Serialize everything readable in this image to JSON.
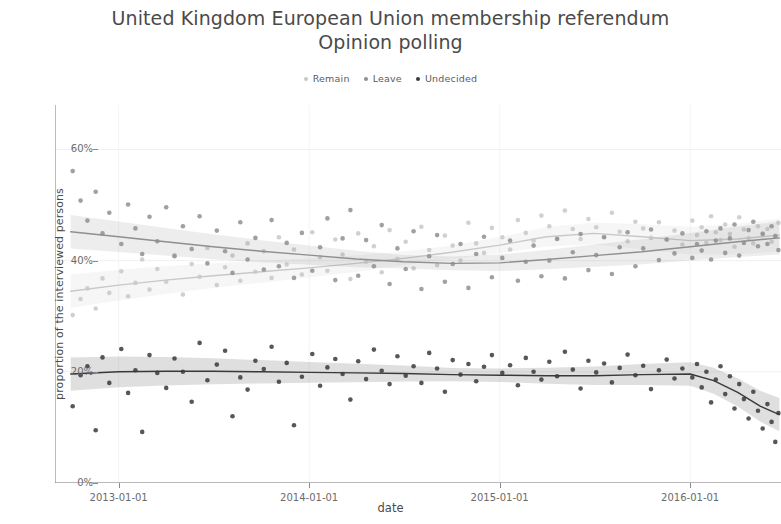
{
  "title": {
    "line1": "United Kingdom European Union membership referendum",
    "line2": "Opinion polling"
  },
  "legend": {
    "position": "top-center",
    "items": [
      {
        "label": "Remain",
        "color": "#c8c8c8"
      },
      {
        "label": "Leave",
        "color": "#8f8f8f"
      },
      {
        "label": "Undecided",
        "color": "#3a3a3a"
      }
    ]
  },
  "axes": {
    "ylabel": "proportion of the interviewed persons",
    "xlabel": "date",
    "yticks": [
      "0%",
      "20%",
      "40%",
      "60%"
    ],
    "xticks": [
      "2013-01-01",
      "2014-01-01",
      "2015-01-01",
      "2016-01-01"
    ]
  },
  "chart_data": {
    "type": "scatter",
    "title": "United Kingdom European Union membership referendum Opinion polling",
    "xlabel": "date",
    "ylabel": "proportion of the interviewed persons",
    "grid": true,
    "legend_position": "top-center",
    "xlim": [
      "2012-09-01",
      "2016-06-23"
    ],
    "ylim": [
      0,
      0.68
    ],
    "ytick_values": [
      0,
      20,
      40,
      60
    ],
    "ytick_labels": [
      "0%",
      "20%",
      "40%",
      "60%"
    ],
    "xtick_values": [
      "2013-01-01",
      "2014-01-01",
      "2015-01-01",
      "2016-01-01"
    ],
    "series": [
      {
        "name": "Remain",
        "color": "#c8c8c8",
        "trend": {
          "x": [
            "2012-10-01",
            "2013-01-01",
            "2013-04-01",
            "2013-07-01",
            "2013-10-01",
            "2014-01-01",
            "2014-04-01",
            "2014-07-01",
            "2014-10-01",
            "2015-01-01",
            "2015-04-01",
            "2015-07-01",
            "2015-10-01",
            "2016-01-01",
            "2016-04-01",
            "2016-06-20"
          ],
          "y": [
            34.5,
            35.6,
            36.5,
            37.3,
            38.0,
            38.7,
            39.5,
            40.4,
            41.5,
            42.8,
            44.3,
            44.9,
            44.3,
            43.6,
            43.9,
            44.6
          ]
        },
        "points": {
          "x": [
            "2012-10-05",
            "2012-10-20",
            "2012-11-02",
            "2012-11-18",
            "2012-12-01",
            "2012-12-14",
            "2013-01-06",
            "2013-01-19",
            "2013-02-02",
            "2013-02-15",
            "2013-03-01",
            "2013-03-16",
            "2013-04-02",
            "2013-04-18",
            "2013-05-04",
            "2013-05-21",
            "2013-06-05",
            "2013-06-20",
            "2013-07-08",
            "2013-07-24",
            "2013-08-07",
            "2013-08-22",
            "2013-09-05",
            "2013-09-20",
            "2013-10-06",
            "2013-10-21",
            "2013-11-04",
            "2013-11-19",
            "2013-12-03",
            "2013-12-18",
            "2014-01-07",
            "2014-01-22",
            "2014-02-05",
            "2014-02-20",
            "2014-03-06",
            "2014-03-21",
            "2014-04-05",
            "2014-04-20",
            "2014-05-05",
            "2014-05-20",
            "2014-06-04",
            "2014-06-19",
            "2014-07-05",
            "2014-07-20",
            "2014-08-04",
            "2014-08-19",
            "2014-09-03",
            "2014-09-18",
            "2014-10-03",
            "2014-10-18",
            "2014-11-02",
            "2014-11-17",
            "2014-12-02",
            "2014-12-17",
            "2015-01-06",
            "2015-01-21",
            "2015-02-05",
            "2015-02-20",
            "2015-03-07",
            "2015-03-22",
            "2015-04-06",
            "2015-04-21",
            "2015-05-06",
            "2015-05-21",
            "2015-06-05",
            "2015-06-20",
            "2015-07-05",
            "2015-07-20",
            "2015-08-04",
            "2015-08-19",
            "2015-09-03",
            "2015-09-18",
            "2015-10-03",
            "2015-10-18",
            "2015-11-02",
            "2015-11-17",
            "2015-12-02",
            "2015-12-17",
            "2016-01-05",
            "2016-01-14",
            "2016-01-23",
            "2016-02-01",
            "2016-02-10",
            "2016-02-19",
            "2016-02-28",
            "2016-03-08",
            "2016-03-17",
            "2016-03-26",
            "2016-04-04",
            "2016-04-13",
            "2016-04-22",
            "2016-05-01",
            "2016-05-10",
            "2016-05-19",
            "2016-05-28",
            "2016-06-05",
            "2016-06-12",
            "2016-06-18"
          ],
          "y": [
            30.2,
            33.1,
            35.0,
            31.4,
            36.8,
            34.2,
            38.1,
            33.6,
            36.0,
            40.2,
            34.8,
            38.5,
            36.2,
            41.0,
            33.9,
            39.4,
            37.1,
            42.3,
            35.6,
            38.8,
            40.9,
            36.4,
            43.1,
            38.0,
            41.7,
            36.9,
            44.2,
            39.3,
            42.0,
            37.5,
            45.1,
            40.6,
            38.2,
            43.8,
            41.1,
            36.7,
            44.9,
            39.8,
            42.6,
            37.9,
            45.5,
            40.3,
            43.4,
            38.6,
            46.1,
            41.9,
            39.2,
            44.5,
            42.7,
            40.0,
            46.8,
            43.1,
            41.4,
            45.9,
            44.2,
            42.0,
            47.3,
            45.0,
            43.6,
            48.1,
            46.2,
            44.0,
            49.0,
            45.7,
            43.9,
            47.5,
            46.0,
            44.3,
            48.6,
            45.2,
            43.5,
            47.0,
            45.8,
            44.1,
            46.9,
            43.8,
            45.4,
            42.9,
            47.2,
            44.6,
            46.0,
            43.2,
            48.0,
            45.1,
            43.7,
            46.5,
            44.8,
            42.5,
            47.8,
            45.6,
            44.0,
            43.1,
            46.2,
            44.9,
            45.7,
            43.4,
            44.5,
            46.8,
            45.0,
            44.2
          ]
        }
      },
      {
        "name": "Leave",
        "color": "#8f8f8f",
        "trend": {
          "x": [
            "2012-10-01",
            "2013-01-01",
            "2013-04-01",
            "2013-07-01",
            "2013-10-01",
            "2014-01-01",
            "2014-04-01",
            "2014-07-01",
            "2014-10-01",
            "2015-01-01",
            "2015-04-01",
            "2015-07-01",
            "2015-10-01",
            "2016-01-01",
            "2016-04-01",
            "2016-06-20"
          ],
          "y": [
            45.2,
            44.3,
            43.4,
            42.5,
            41.7,
            41.0,
            40.3,
            39.8,
            39.5,
            39.6,
            40.2,
            40.9,
            41.6,
            42.5,
            43.4,
            44.1
          ]
        },
        "points": {
          "x": [
            "2012-10-05",
            "2012-10-20",
            "2012-11-02",
            "2012-11-18",
            "2012-12-01",
            "2012-12-14",
            "2013-01-06",
            "2013-01-19",
            "2013-02-02",
            "2013-02-15",
            "2013-03-01",
            "2013-03-16",
            "2013-04-02",
            "2013-04-18",
            "2013-05-04",
            "2013-05-21",
            "2013-06-05",
            "2013-06-20",
            "2013-07-08",
            "2013-07-24",
            "2013-08-07",
            "2013-08-22",
            "2013-09-05",
            "2013-09-20",
            "2013-10-06",
            "2013-10-21",
            "2013-11-04",
            "2013-11-19",
            "2013-12-03",
            "2013-12-18",
            "2014-01-07",
            "2014-01-22",
            "2014-02-05",
            "2014-02-20",
            "2014-03-06",
            "2014-03-21",
            "2014-04-05",
            "2014-04-20",
            "2014-05-05",
            "2014-05-20",
            "2014-06-04",
            "2014-06-19",
            "2014-07-05",
            "2014-07-20",
            "2014-08-04",
            "2014-08-19",
            "2014-09-03",
            "2014-09-18",
            "2014-10-03",
            "2014-10-18",
            "2014-11-02",
            "2014-11-17",
            "2014-12-02",
            "2014-12-17",
            "2015-01-06",
            "2015-01-21",
            "2015-02-05",
            "2015-02-20",
            "2015-03-07",
            "2015-03-22",
            "2015-04-06",
            "2015-04-21",
            "2015-05-06",
            "2015-05-21",
            "2015-06-05",
            "2015-06-20",
            "2015-07-05",
            "2015-07-20",
            "2015-08-04",
            "2015-08-19",
            "2015-09-03",
            "2015-09-18",
            "2015-10-03",
            "2015-10-18",
            "2015-11-02",
            "2015-11-17",
            "2015-12-02",
            "2015-12-17",
            "2016-01-05",
            "2016-01-14",
            "2016-01-23",
            "2016-02-01",
            "2016-02-10",
            "2016-02-19",
            "2016-02-28",
            "2016-03-08",
            "2016-03-17",
            "2016-03-26",
            "2016-04-04",
            "2016-04-13",
            "2016-04-22",
            "2016-05-01",
            "2016-05-10",
            "2016-05-19",
            "2016-05-28",
            "2016-06-05",
            "2016-06-12",
            "2016-06-18"
          ],
          "y": [
            56.1,
            50.8,
            47.2,
            52.4,
            44.9,
            48.6,
            43.0,
            50.1,
            45.8,
            41.2,
            47.9,
            43.5,
            49.6,
            40.8,
            46.2,
            42.1,
            48.0,
            39.5,
            45.4,
            41.7,
            37.8,
            46.9,
            40.2,
            44.1,
            38.4,
            47.3,
            39.0,
            43.2,
            36.9,
            45.0,
            38.2,
            42.4,
            47.6,
            36.5,
            44.0,
            49.1,
            37.3,
            43.7,
            39.0,
            46.4,
            35.8,
            42.2,
            38.5,
            45.3,
            34.9,
            40.8,
            44.6,
            36.2,
            39.4,
            43.0,
            35.1,
            41.2,
            44.3,
            37.0,
            40.5,
            43.6,
            36.4,
            39.8,
            42.7,
            37.2,
            40.0,
            43.9,
            36.8,
            41.5,
            44.8,
            38.3,
            41.0,
            44.2,
            37.6,
            42.4,
            45.1,
            39.0,
            42.2,
            45.6,
            40.1,
            43.8,
            41.3,
            44.9,
            40.5,
            43.0,
            41.8,
            45.3,
            40.2,
            43.6,
            45.8,
            41.4,
            44.0,
            46.5,
            40.9,
            43.2,
            45.5,
            47.0,
            42.6,
            44.8,
            43.0,
            46.2,
            44.4,
            41.9,
            43.8,
            44.7
          ]
        }
      },
      {
        "name": "Undecided",
        "color": "#3a3a3a",
        "trend": {
          "x": [
            "2012-10-01",
            "2013-01-01",
            "2013-04-01",
            "2013-07-01",
            "2013-10-01",
            "2014-01-01",
            "2014-04-01",
            "2014-07-01",
            "2014-10-01",
            "2015-01-01",
            "2015-04-01",
            "2015-07-01",
            "2015-10-01",
            "2016-01-01",
            "2016-02-15",
            "2016-04-01",
            "2016-05-15",
            "2016-06-20"
          ],
          "y": [
            19.6,
            20.0,
            20.1,
            20.1,
            20.0,
            19.9,
            19.8,
            19.7,
            19.5,
            19.4,
            19.3,
            19.3,
            19.5,
            19.6,
            18.4,
            16.3,
            13.8,
            12.3
          ]
        },
        "points": {
          "x": [
            "2012-10-05",
            "2012-10-20",
            "2012-11-02",
            "2012-11-18",
            "2012-12-01",
            "2012-12-14",
            "2013-01-06",
            "2013-01-19",
            "2013-02-02",
            "2013-02-15",
            "2013-03-01",
            "2013-03-16",
            "2013-04-02",
            "2013-04-18",
            "2013-05-04",
            "2013-05-21",
            "2013-06-05",
            "2013-06-20",
            "2013-07-08",
            "2013-07-24",
            "2013-08-07",
            "2013-08-22",
            "2013-09-05",
            "2013-09-20",
            "2013-10-06",
            "2013-10-21",
            "2013-11-04",
            "2013-11-19",
            "2013-12-03",
            "2013-12-18",
            "2014-01-07",
            "2014-01-22",
            "2014-02-05",
            "2014-02-20",
            "2014-03-06",
            "2014-03-21",
            "2014-04-05",
            "2014-04-20",
            "2014-05-05",
            "2014-05-20",
            "2014-06-04",
            "2014-06-19",
            "2014-07-05",
            "2014-07-20",
            "2014-08-04",
            "2014-08-19",
            "2014-09-03",
            "2014-09-18",
            "2014-10-03",
            "2014-10-18",
            "2014-11-02",
            "2014-11-17",
            "2014-12-02",
            "2014-12-17",
            "2015-01-06",
            "2015-01-21",
            "2015-02-05",
            "2015-02-20",
            "2015-03-07",
            "2015-03-22",
            "2015-04-06",
            "2015-04-21",
            "2015-05-06",
            "2015-05-21",
            "2015-06-05",
            "2015-06-20",
            "2015-07-05",
            "2015-07-20",
            "2015-08-04",
            "2015-08-19",
            "2015-09-03",
            "2015-09-18",
            "2015-10-03",
            "2015-10-18",
            "2015-11-02",
            "2015-11-17",
            "2015-12-02",
            "2015-12-17",
            "2016-01-05",
            "2016-01-14",
            "2016-01-23",
            "2016-02-01",
            "2016-02-10",
            "2016-02-19",
            "2016-02-28",
            "2016-03-08",
            "2016-03-17",
            "2016-03-26",
            "2016-04-04",
            "2016-04-13",
            "2016-04-22",
            "2016-05-01",
            "2016-05-10",
            "2016-05-19",
            "2016-05-28",
            "2016-06-05",
            "2016-06-12",
            "2016-06-18"
          ],
          "y": [
            13.8,
            19.4,
            21.0,
            9.5,
            22.6,
            18.0,
            24.1,
            16.2,
            20.3,
            9.2,
            23.0,
            19.8,
            17.1,
            22.4,
            20.0,
            14.6,
            25.2,
            18.5,
            21.3,
            23.8,
            12.0,
            19.0,
            16.8,
            22.0,
            20.5,
            24.5,
            18.2,
            21.6,
            10.4,
            19.1,
            23.2,
            17.5,
            20.8,
            22.3,
            19.6,
            15.0,
            21.9,
            18.7,
            24.0,
            20.2,
            17.8,
            22.8,
            19.3,
            21.0,
            18.0,
            23.4,
            20.6,
            16.4,
            22.1,
            19.5,
            21.4,
            18.3,
            20.9,
            23.0,
            19.8,
            21.2,
            17.6,
            22.5,
            20.0,
            18.6,
            21.8,
            19.2,
            23.6,
            20.4,
            17.0,
            22.0,
            19.9,
            21.5,
            18.1,
            20.7,
            23.1,
            19.4,
            21.1,
            16.9,
            20.3,
            22.2,
            18.8,
            20.6,
            19.0,
            21.4,
            17.2,
            20.0,
            14.5,
            18.6,
            21.0,
            16.0,
            19.2,
            13.4,
            17.8,
            15.1,
            11.6,
            16.4,
            13.0,
            9.8,
            14.2,
            11.0,
            7.4,
            12.6,
            9.0,
            5.2
          ]
        }
      }
    ]
  }
}
